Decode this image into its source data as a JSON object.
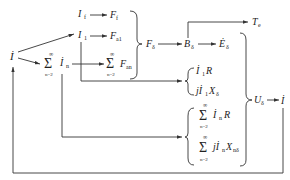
{
  "diagram": {
    "type": "signal-flow",
    "nodes": {
      "I": "İ",
      "If": "I",
      "If_sub": "f",
      "Ff": "F",
      "Ff_sub": "f",
      "I1": "I",
      "I1_sub": "1",
      "Fa1": "F",
      "Fa1_sub": "a1",
      "sum_In": "İ",
      "sum_In_sub": "n",
      "sum_Fan": "F",
      "sum_Fan_sub": "an",
      "sigma": "Σ",
      "sum_upper": "∞",
      "sum_lower": "n=2",
      "Fd": "F",
      "Fd_sub": "δ",
      "Bd": "B",
      "Bd_sub": "δ",
      "Ed": "Ė",
      "Ed_sub": "δ",
      "Te": "T",
      "Te_sub": "e",
      "I1R": "İ",
      "I1R_sub": "1",
      "I1R_tail": "R",
      "jI1X": "jİ",
      "jI1X_sub": "1",
      "jI1X_x": "X",
      "jI1X_xsub": "δ",
      "InR": "İ",
      "InR_sub": "n",
      "InR_tail": "R",
      "jInX": "jİ",
      "jInX_sub": "n",
      "jInX_x": "X",
      "jInX_xsub": "nδ",
      "Ud": "U",
      "Ud_sub": "δ",
      "Iout": "İ"
    }
  }
}
